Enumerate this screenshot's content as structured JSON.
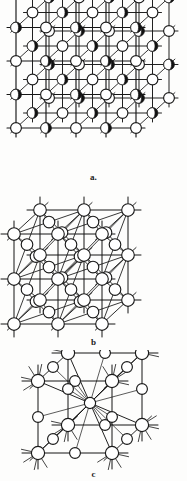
{
  "figure": {
    "background_color": "#fdfdfc",
    "stroke_color": "#1a1a1a",
    "atom_fill_open": "#ffffff",
    "atom_fill_solid": "#111111",
    "width": 187,
    "height": 481
  },
  "panels": [
    {
      "id": "a",
      "label": "a.",
      "caption": "a.",
      "structure_type": "rock-salt",
      "description": "Cubic ionic lattice with alternating open and filled spheres at lattice points, bonds drawn along three orthogonal axes in oblique projection",
      "atom_kinds": [
        "open",
        "filled"
      ],
      "grid_cols": 5,
      "grid_rows": 5,
      "depth_layers": 3
    },
    {
      "id": "b",
      "label": "b",
      "caption": "b",
      "structure_type": "face-centred-cubic",
      "description": "Face-centred cubic lattice, all spheres open, with face-diagonal bonds added between nearest neighbours",
      "atom_kinds": [
        "open"
      ],
      "grid_cols": 3,
      "grid_rows": 3,
      "depth_layers": 2
    },
    {
      "id": "c",
      "label": "c",
      "caption": "c",
      "structure_type": "body-centred-cubic",
      "description": "Single body-centred cubic unit cell with corner, edge-centre and body-centre spheres, body-diagonal bonds and protruding bond stubs",
      "atom_kinds": [
        "open"
      ],
      "grid_cols": 2,
      "grid_rows": 2,
      "depth_layers": 2
    }
  ],
  "chart_data": {
    "type": "diagram",
    "panels": [
      "a.",
      "b",
      "c"
    ]
  }
}
